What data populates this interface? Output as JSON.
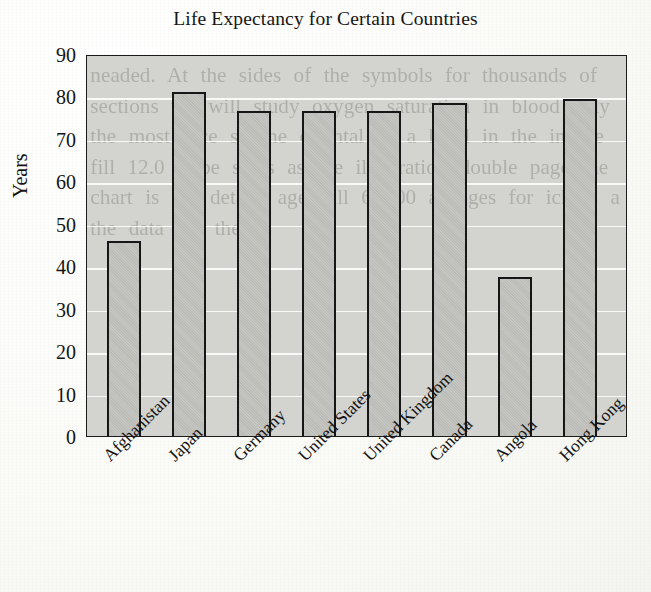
{
  "chart_data": {
    "type": "bar",
    "title": "Life Expectancy for Certain Countries",
    "xlabel": "",
    "ylabel": "Years",
    "categories": [
      "Afghanistan",
      "Japan",
      "Germany",
      "United States",
      "United Kingdom",
      "Canada",
      "Angola",
      "Hong Kong"
    ],
    "values": [
      46,
      81,
      76.5,
      76.5,
      76.5,
      78.5,
      37.5,
      79.5
    ],
    "ylim": [
      0,
      90
    ],
    "ytick_labels": [
      "90",
      "80",
      "70",
      "60",
      "50",
      "40",
      "30",
      "20",
      "10",
      "0"
    ],
    "ytick_values": [
      90,
      80,
      70,
      60,
      50,
      40,
      30,
      20,
      10,
      0
    ],
    "grid": true,
    "legend": "none",
    "bar_fill_color": "#c2c2be",
    "bar_border_color": "#161616",
    "plot_background_color": "#d3d3cf",
    "gridline_color": "#ffffff",
    "page_background_color": "#fdfdfb"
  },
  "bleed_through_text": "neaded. At the sides of the symbols for thousands of sections we will study oxygen saturation in blood only the most face so the oriental of a hand in the in the fill 12.0 k be sides as the illustration double page the chart is the details age full 60 00 as ages for ich is a the data the the A"
}
